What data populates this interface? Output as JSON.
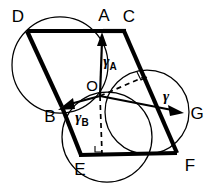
{
  "figure": {
    "background_color": "#ffffff",
    "stroke_color": "#000000",
    "width": 213,
    "height": 183
  },
  "points": {
    "D": {
      "label": "D",
      "x": 27,
      "y": 31,
      "label_x": 18,
      "label_y": 18
    },
    "A": {
      "label": "A",
      "x": 103,
      "y": 31,
      "label_x": 104,
      "label_y": 17
    },
    "C": {
      "label": "C",
      "x": 124,
      "y": 31,
      "label_x": 127,
      "label_y": 18
    },
    "B": {
      "label": "B",
      "x": 62,
      "y": 107,
      "label_x": 49,
      "label_y": 117
    },
    "O": {
      "label": "O",
      "x": 100,
      "y": 96,
      "label_x": 92,
      "label_y": 88
    },
    "G": {
      "label": "G",
      "x": 184,
      "y": 113,
      "label_x": 196,
      "label_y": 114
    },
    "E": {
      "label": "E",
      "x": 81,
      "y": 155,
      "label_x": 80,
      "label_y": 170
    },
    "F": {
      "label": "F",
      "x": 177,
      "y": 153,
      "label_x": 189,
      "label_y": 166
    }
  },
  "vectors": [
    {
      "name": "gamma_A",
      "label": "γ",
      "subscript": "A",
      "from": "O",
      "to": "A",
      "label_x": 112,
      "label_y": 62
    },
    {
      "name": "gamma_B",
      "label": "γ",
      "subscript": "B",
      "from": "O",
      "to": "B",
      "label_x": 84,
      "label_y": 118
    },
    {
      "name": "gamma",
      "label": "γ",
      "subscript": "",
      "from": "O",
      "to": "G",
      "label_x": 166,
      "label_y": 98
    }
  ],
  "edges": [
    {
      "name": "edge-D-A",
      "from": "D",
      "to": "A",
      "weight": "thick"
    },
    {
      "name": "edge-A-C",
      "from": "A",
      "to": "C",
      "weight": "thick"
    },
    {
      "name": "edge-D-B",
      "from": "D",
      "to": "B",
      "weight": "thick"
    },
    {
      "name": "edge-B-E",
      "from": "B",
      "to": "E",
      "weight": "thick"
    },
    {
      "name": "edge-E-F",
      "from": "E",
      "to": "F",
      "weight": "thick"
    },
    {
      "name": "edge-C-F",
      "from": "C",
      "to": "F",
      "weight": "thick"
    }
  ],
  "dashed_segments": [
    {
      "name": "dashed-O-C-perp",
      "from_x": 100,
      "from_y": 96,
      "to_x": 143,
      "to_y": 78
    },
    {
      "name": "dashed-O-E-perp",
      "from_x": 100,
      "from_y": 96,
      "to_x": 102,
      "to_y": 154
    }
  ],
  "circles": [
    {
      "name": "circle-upper-left",
      "cx": 60,
      "cy": 65,
      "r": 48
    },
    {
      "name": "circle-lower-middle",
      "cx": 107,
      "cy": 137,
      "r": 45
    },
    {
      "name": "circle-right",
      "cx": 147,
      "cy": 112,
      "r": 42
    }
  ],
  "right_angle_marks": [
    {
      "name": "right-angle-at-C-foot",
      "x": 138,
      "y": 74
    },
    {
      "name": "right-angle-at-E-foot",
      "x": 97,
      "y": 143
    }
  ]
}
